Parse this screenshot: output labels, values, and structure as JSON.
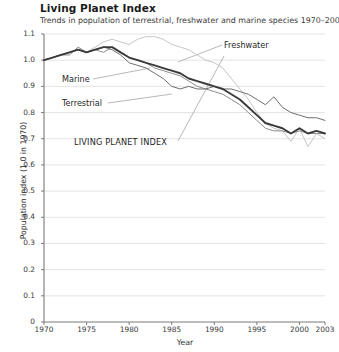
{
  "header": {
    "title": "Living Planet Index",
    "subtitle": "Trends in population of terrestrial, freshwater and marine species 1970–2003."
  },
  "chart_data": {
    "type": "line",
    "title": "Living Planet Index",
    "subtitle": "Trends in population of terrestrial, freshwater and marine species 1970–2003.",
    "xlabel": "Year",
    "ylabel": "Population index (1.0 in 1970)",
    "xlim": [
      1970,
      2003
    ],
    "ylim": [
      0,
      1.1
    ],
    "grid": "horizontal",
    "legend_position": "inline-annotations",
    "ytick_labels": [
      "0",
      "0.1",
      "0.2",
      "0.3",
      "0.4",
      "0.5",
      "0.6",
      "0.7",
      "0.8",
      "0.9",
      "1.0",
      "1.1"
    ],
    "ytick_values": [
      0,
      0.1,
      0.2,
      0.3,
      0.4,
      0.5,
      0.6,
      0.7,
      0.8,
      0.9,
      1.0,
      1.1
    ],
    "xtick_labels": [
      "1970",
      "1975",
      "1980",
      "1985",
      "1990",
      "1995",
      "2000",
      "2003"
    ],
    "xtick_values": [
      1970,
      1975,
      1980,
      1985,
      1990,
      1995,
      2000,
      2003
    ],
    "x": [
      1970,
      1971,
      1972,
      1973,
      1974,
      1975,
      1976,
      1977,
      1978,
      1979,
      1980,
      1981,
      1982,
      1983,
      1984,
      1985,
      1986,
      1987,
      1988,
      1989,
      1990,
      1991,
      1992,
      1993,
      1994,
      1995,
      1996,
      1997,
      1998,
      1999,
      2000,
      2001,
      2002,
      2003
    ],
    "series": [
      {
        "name": "Freshwater",
        "color": "#c6c6c6",
        "width": 1.0,
        "values": [
          1.0,
          1.01,
          1.02,
          1.03,
          1.04,
          1.03,
          1.05,
          1.07,
          1.08,
          1.07,
          1.06,
          1.08,
          1.09,
          1.09,
          1.08,
          1.06,
          1.05,
          1.04,
          1.02,
          1.0,
          0.99,
          0.97,
          0.93,
          0.89,
          0.85,
          0.8,
          0.76,
          0.74,
          0.73,
          0.69,
          0.74,
          0.67,
          0.72,
          0.7
        ]
      },
      {
        "name": "Marine",
        "color": "#8c8c8c",
        "width": 1.0,
        "values": [
          1.0,
          1.01,
          1.02,
          1.02,
          1.05,
          1.03,
          1.04,
          1.03,
          1.05,
          1.03,
          1.01,
          1.0,
          0.99,
          0.97,
          0.96,
          0.95,
          0.94,
          0.92,
          0.9,
          0.89,
          0.88,
          0.87,
          0.85,
          0.83,
          0.8,
          0.77,
          0.74,
          0.73,
          0.73,
          0.72,
          0.73,
          0.72,
          0.72,
          0.72
        ]
      },
      {
        "name": "Terrestrial",
        "color": "#6e6e6e",
        "width": 1.0,
        "values": [
          1.0,
          1.01,
          1.02,
          1.03,
          1.04,
          1.03,
          1.04,
          1.05,
          1.04,
          1.02,
          0.99,
          0.98,
          0.97,
          0.95,
          0.93,
          0.9,
          0.89,
          0.9,
          0.89,
          0.89,
          0.9,
          0.89,
          0.89,
          0.88,
          0.87,
          0.85,
          0.83,
          0.86,
          0.82,
          0.8,
          0.79,
          0.78,
          0.78,
          0.77
        ]
      },
      {
        "name": "LIVING PLANET INDEX",
        "color": "#3a3a3a",
        "width": 1.9,
        "values": [
          1.0,
          1.01,
          1.02,
          1.03,
          1.04,
          1.03,
          1.04,
          1.05,
          1.05,
          1.03,
          1.01,
          1.0,
          0.99,
          0.98,
          0.97,
          0.96,
          0.95,
          0.93,
          0.92,
          0.91,
          0.9,
          0.89,
          0.87,
          0.85,
          0.82,
          0.79,
          0.76,
          0.75,
          0.74,
          0.72,
          0.74,
          0.72,
          0.73,
          0.72
        ]
      }
    ],
    "annotations": [
      {
        "label": "Freshwater",
        "series": "Freshwater"
      },
      {
        "label": "Marine",
        "series": "Marine"
      },
      {
        "label": "Terrestrial",
        "series": "Terrestrial"
      },
      {
        "label": "LIVING PLANET INDEX",
        "series": "LIVING PLANET INDEX"
      }
    ]
  },
  "colors": {
    "axis": "#7a7a7a",
    "grid": "#d9d9d9",
    "text": "#231f20"
  }
}
